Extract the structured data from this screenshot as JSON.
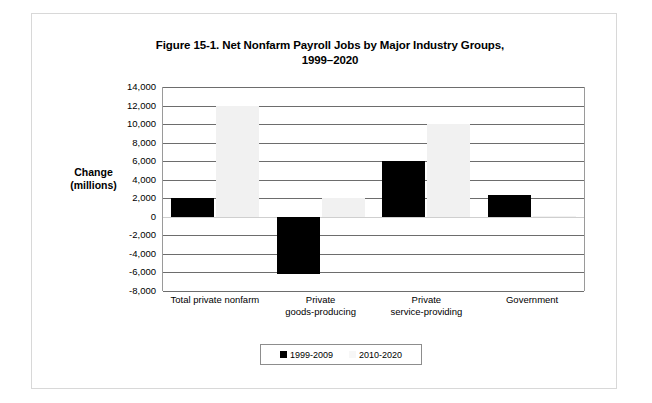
{
  "figure": {
    "title_line1": "Figure 15-1. Net Nonfarm Payroll Jobs by Major Industry Groups,",
    "title_line2": "1999–2020",
    "axis_title_line1": "Change",
    "axis_title_line2": "(millions)"
  },
  "colors": {
    "series_1999_2009": "#000000",
    "series_2010_2020": "#f1f1f1",
    "gridline": "#6d6d6d",
    "zero_line": "#cfcfcf",
    "frame": "#d8d8d8"
  },
  "chart_data": {
    "type": "bar",
    "title": "Figure 15-1. Net Nonfarm Payroll Jobs by Major Industry Groups, 1999–2020",
    "xlabel": "",
    "ylabel": "Change (millions)",
    "ylim": [
      -8000,
      14000
    ],
    "ytick_step": 2000,
    "yticks": [
      "14,000",
      "12,000",
      "10,000",
      "8,000",
      "6,000",
      "4,000",
      "2,000",
      "0",
      "-2,000",
      "-4,000",
      "-6,000",
      "-8,000"
    ],
    "ytick_values": [
      14000,
      12000,
      10000,
      8000,
      6000,
      4000,
      2000,
      0,
      -2000,
      -4000,
      -6000,
      -8000
    ],
    "grid": true,
    "legend_position": "bottom",
    "categories": [
      "Total private nonfarm",
      "Private goods-producing",
      "Private service-providing",
      "Government"
    ],
    "category_lines": [
      [
        "Total private nonfarm"
      ],
      [
        "Private",
        "goods-producing"
      ],
      [
        "Private",
        "service-providing"
      ],
      [
        "Government"
      ]
    ],
    "series": [
      {
        "name": "1999-2009",
        "color": "#000000",
        "values": [
          2000,
          -6200,
          6000,
          2400
        ]
      },
      {
        "name": "2010-2020",
        "color": "#f1f1f1",
        "values": [
          12000,
          2000,
          10000,
          100
        ]
      }
    ]
  }
}
